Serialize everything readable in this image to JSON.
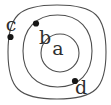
{
  "diagram": {
    "type": "concentric-shells",
    "description_name": "three-nested-rings-with-labeled-points",
    "colors": {
      "background": "#ffffff",
      "ring_stroke": "#4f4f4f",
      "dot_fill": "#161616",
      "label_color": "#2e2e2e"
    },
    "rings": [
      {
        "name": "outer-shell"
      },
      {
        "name": "middle-shell"
      },
      {
        "name": "inner-shell"
      }
    ],
    "labels": {
      "a": {
        "text": "a",
        "location": "center-of-inner-shell",
        "x": 58,
        "y": 50
      },
      "b": {
        "text": "b",
        "location": "below-dot-on-middle-shell-upper-left",
        "x": 45,
        "y": 36
      },
      "c": {
        "text": "c",
        "location": "above-dot-on-outer-shell-left",
        "x": 11,
        "y": 25
      },
      "d": {
        "text": "d",
        "location": "below-dot-on-middle-shell-lower-right",
        "x": 81,
        "y": 88
      }
    },
    "dots": [
      {
        "for_label": "b",
        "on_ring": "middle-shell",
        "x": 36,
        "y": 23.5
      },
      {
        "for_label": "c",
        "on_ring": "outer-shell",
        "x": 10.5,
        "y": 37
      },
      {
        "for_label": "d",
        "on_ring": "middle-shell",
        "x": 75,
        "y": 81
      }
    ]
  }
}
